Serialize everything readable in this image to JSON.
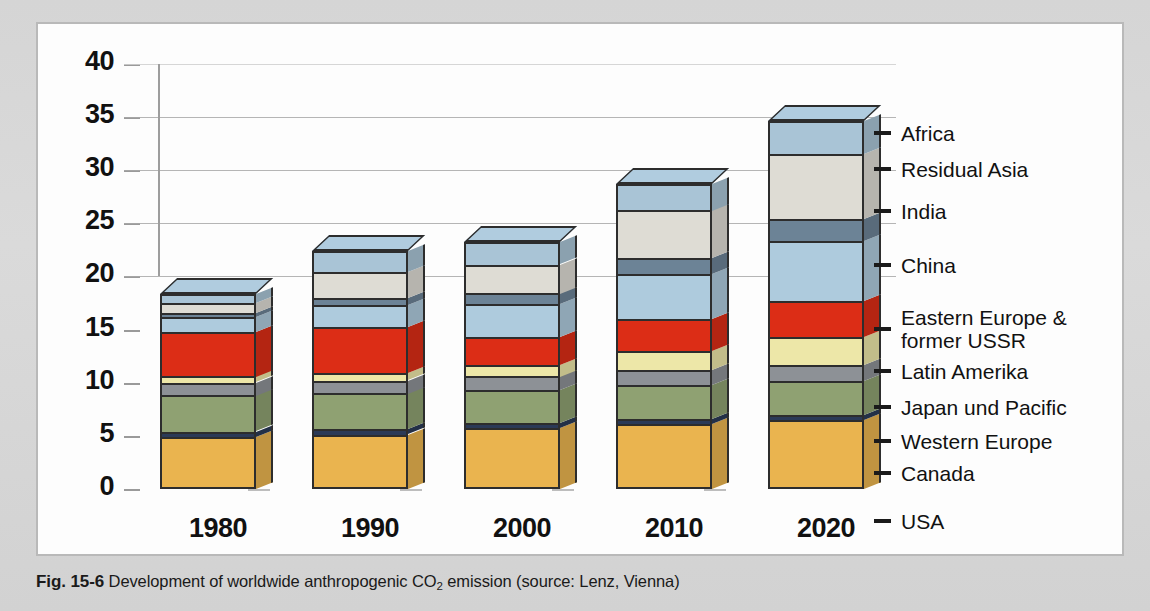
{
  "caption": {
    "figure_number": "Fig. 15-6",
    "text_before_sub": "Development of worldwide anthropogenic CO",
    "subscript": "2",
    "text_after_sub": " emission (source: Lenz, Vienna)"
  },
  "chart_data": {
    "type": "bar",
    "subtype": "stacked-3d-column",
    "title": "Development of worldwide anthropogenic CO2 emission",
    "xlabel": "",
    "ylabel": "",
    "ylim": [
      0,
      40
    ],
    "ytick_labels": [
      "0",
      "5",
      "10",
      "15",
      "20",
      "25",
      "30",
      "35",
      "40"
    ],
    "yticks": [
      0,
      5,
      10,
      15,
      20,
      25,
      30,
      35,
      40
    ],
    "grid": true,
    "legend_position": "right",
    "categories": [
      "1980",
      "1990",
      "2000",
      "2010",
      "2020"
    ],
    "totals": [
      18.3,
      22.4,
      23.2,
      28.7,
      34.6
    ],
    "series": [
      {
        "name": "USA",
        "color": "#eab44f",
        "values": [
          4.9,
          5.1,
          5.7,
          6.1,
          6.5
        ]
      },
      {
        "name": "Canada",
        "color": "#2b3a57",
        "values": [
          0.5,
          0.5,
          0.5,
          0.5,
          0.5
        ]
      },
      {
        "name": "Western Europe",
        "color": "#8fa172",
        "values": [
          3.4,
          3.4,
          3.1,
          3.2,
          3.2
        ]
      },
      {
        "name": "Japan und Pacific",
        "color": "#8d9196",
        "values": [
          1.2,
          1.2,
          1.3,
          1.4,
          1.5
        ]
      },
      {
        "name": "Latin Amerika",
        "color": "#ede7a8",
        "values": [
          0.6,
          0.7,
          1.1,
          1.8,
          2.6
        ]
      },
      {
        "name": "Eastern Europe & former USSR",
        "color": "#dc2d16",
        "values": [
          4.2,
          4.3,
          2.6,
          3.0,
          3.4
        ]
      },
      {
        "name": "China",
        "color": "#aecbdd",
        "values": [
          1.4,
          2.1,
          3.1,
          4.2,
          5.6
        ]
      },
      {
        "name": "India",
        "color": "#6c8396",
        "values": [
          0.4,
          0.7,
          1.0,
          1.5,
          2.1
        ]
      },
      {
        "name": "Residual Asia",
        "color": "#dedcd4",
        "values": [
          0.9,
          2.4,
          2.7,
          4.5,
          6.1
        ]
      },
      {
        "name": "Africa",
        "color": "#a9c4d6",
        "values": [
          0.8,
          2.0,
          2.1,
          2.5,
          3.1
        ]
      }
    ]
  },
  "legend": {
    "entries": [
      {
        "label": "Africa"
      },
      {
        "label": "Residual Asia"
      },
      {
        "label": "India"
      },
      {
        "label": "China"
      },
      {
        "label": "Eastern Europe &\nformer USSR"
      },
      {
        "label": "Latin Amerika"
      },
      {
        "label": "Japan und Pacific"
      },
      {
        "label": "Western Europe"
      },
      {
        "label": "Canada"
      },
      {
        "label": "USA"
      }
    ]
  },
  "colors": {
    "page_background": "#d9d9d9",
    "panel_background": "#fdfdfd",
    "panel_border": "#b9b9b9",
    "gridline": "#a8a8a8",
    "outline": "#2d2d2d",
    "text": "#111111"
  }
}
